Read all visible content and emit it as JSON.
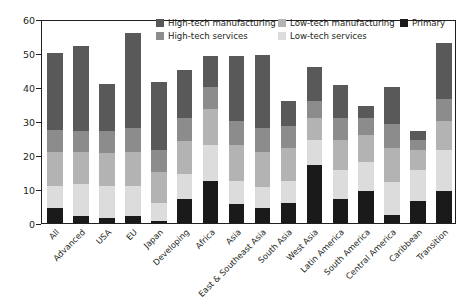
{
  "chart_data": {
    "type": "bar",
    "subtype": "stacked-vertical",
    "title": "",
    "xlabel": "",
    "ylabel": "Percent",
    "ylim": [
      0,
      60
    ],
    "yticks": [
      0,
      10,
      20,
      30,
      40,
      50,
      60
    ],
    "grid": false,
    "legend_position": "top-right-inside",
    "categories": [
      "All",
      "Advanced",
      "USA",
      "EU",
      "Japan",
      "Developing",
      "Africa",
      "Asia",
      "East & Southeast Asia",
      "South Asia",
      "West Asia",
      "Latin America",
      "South America",
      "Central America",
      "Caribbean",
      "Transition"
    ],
    "series": [
      {
        "name": "Primary",
        "color": "#1a1a1a",
        "values": [
          4.5,
          2.0,
          1.5,
          2.0,
          0.5,
          7.0,
          12.5,
          5.5,
          4.5,
          6.0,
          17.0,
          7.0,
          9.5,
          2.5,
          6.5,
          9.5
        ]
      },
      {
        "name": "Low-tech services",
        "color": "#dcdcdc",
        "values": [
          6.5,
          9.5,
          9.5,
          9.0,
          5.5,
          7.5,
          10.5,
          7.0,
          6.0,
          6.5,
          7.5,
          8.5,
          8.5,
          9.5,
          9.0,
          12.0
        ]
      },
      {
        "name": "Low-tech manufacturing",
        "color": "#b3b3b3",
        "values": [
          10.0,
          9.5,
          9.5,
          10.0,
          9.0,
          9.5,
          10.5,
          10.5,
          10.5,
          9.5,
          6.5,
          9.0,
          8.0,
          10.0,
          6.0,
          8.5
        ]
      },
      {
        "name": "High-tech services",
        "color": "#8c8c8c",
        "values": [
          6.5,
          6.0,
          6.5,
          7.0,
          6.5,
          7.0,
          6.5,
          7.0,
          7.0,
          6.5,
          5.0,
          6.5,
          5.0,
          7.0,
          3.0,
          6.5
        ]
      },
      {
        "name": "High-tech manufacturing",
        "color": "#595959",
        "values": [
          22.5,
          25.0,
          14.0,
          28.0,
          20.0,
          14.0,
          9.0,
          19.0,
          21.5,
          7.5,
          10.0,
          9.5,
          3.5,
          11.0,
          2.5,
          16.5
        ]
      }
    ],
    "bar_totals": [
      50.0,
      52.0,
      41.0,
      56.0,
      41.5,
      45.0,
      49.0,
      49.0,
      49.5,
      36.0,
      46.0,
      40.5,
      34.5,
      40.0,
      27.0,
      53.0
    ],
    "legend_entries": [
      {
        "label": "High-tech manufacturing",
        "color": "#595959"
      },
      {
        "label": "Low-tech manufacturing",
        "color": "#b3b3b3"
      },
      {
        "label": "Primary",
        "color": "#1a1a1a"
      },
      {
        "label": "High-tech services",
        "color": "#8c8c8c"
      },
      {
        "label": "Low-tech services",
        "color": "#dcdcdc"
      }
    ]
  },
  "axis": {
    "y_label": "Percent",
    "y_ticks": [
      "0",
      "10",
      "20",
      "30",
      "40",
      "50",
      "60"
    ]
  },
  "legend": {
    "high_tech_manufacturing": "High-tech manufacturing",
    "low_tech_manufacturing": "Low-tech manufacturing",
    "primary": "Primary",
    "high_tech_services": "High-tech services",
    "low_tech_services": "Low-tech services"
  }
}
